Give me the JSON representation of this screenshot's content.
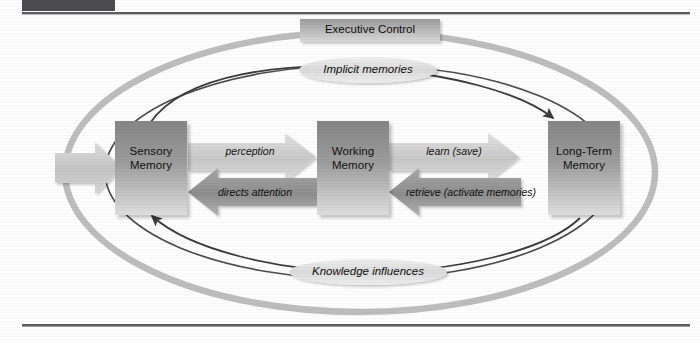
{
  "page": {
    "background_color": "#fdfdfd",
    "top_rule_color": "#5a5a5c",
    "bottom_rule_color": "#5a5a5c",
    "top_block_color": "#4c4c4e"
  },
  "diagram": {
    "outer_ellipse": {
      "name": "executive-control-loop",
      "stroke": "#b4b4b4"
    },
    "inner_ellipse": {
      "name": "memory-flow-loop",
      "stroke": "#4a4a4a"
    },
    "nodes": [
      {
        "id": "sensory",
        "line1": "Sensory",
        "line2": "Memory",
        "fill_top": "#8e8e8e",
        "fill_bottom": "#d8d8d8"
      },
      {
        "id": "working",
        "line1": "Working",
        "line2": "Memory",
        "fill_top": "#8e8e8e",
        "fill_bottom": "#d8d8d8"
      },
      {
        "id": "longterm",
        "line1": "Long-Term",
        "line2": "Memory",
        "fill_top": "#8e8e8e",
        "fill_bottom": "#d8d8d8"
      }
    ],
    "executive_control": {
      "label": "Executive Control",
      "fill_top": "#9a9a9a",
      "fill_bottom": "#d2d2d2"
    },
    "implicit_memories": {
      "label": "Implicit memories",
      "fill": "#dcdcdc"
    },
    "knowledge_influences": {
      "label": "Knowledge influences",
      "fill": "#dcdcdc"
    },
    "arrows": [
      {
        "id": "input",
        "label": "",
        "direction": "right",
        "color": "#c3c3c3"
      },
      {
        "id": "perception",
        "label": "perception",
        "direction": "right",
        "color": "#c9c9c9"
      },
      {
        "id": "directs-attention",
        "label": "directs attention",
        "direction": "left",
        "color": "#9b9b9b"
      },
      {
        "id": "learn-save",
        "label": "learn (save)",
        "direction": "right",
        "color": "#c9c9c9"
      },
      {
        "id": "retrieve",
        "label": "retrieve (activate memories)",
        "direction": "left",
        "color": "#9b9b9b"
      }
    ]
  }
}
